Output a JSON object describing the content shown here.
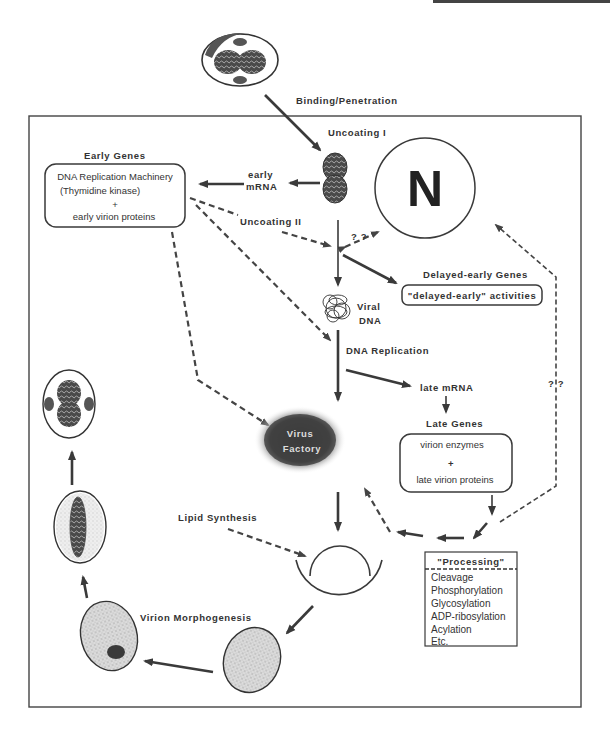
{
  "diagram": {
    "type": "viral replication cycle",
    "labels": {
      "binding": "Binding/Penetration",
      "uncoating1": "Uncoating  I",
      "uncoating2": "Uncoating  II",
      "early_mrna_1": "early",
      "early_mrna_2": "mRNA",
      "early_genes_title": "Early  Genes",
      "early_genes_line1": "DNA Replication Machinery",
      "early_genes_line2": "(Thymidine kinase)",
      "early_genes_plus": "+",
      "early_genes_line3": "early  virion  proteins",
      "nucleus": "N",
      "qq1": "? ?",
      "qq2": "? ?",
      "delayed_title": "Delayed-early  Genes",
      "delayed_box": "\"delayed-early\"  activities",
      "viral_dna_1": "Viral",
      "viral_dna_2": "DNA",
      "dna_replication": "DNA  Replication",
      "late_mrna": "late  mRNA",
      "late_genes_title": "Late  Genes",
      "late_genes_line1": "virion  enzymes",
      "late_genes_plus": "+",
      "late_genes_line2": "late  virion  proteins",
      "factory_1": "Virus",
      "factory_2": "Factory",
      "lipid": "Lipid  Synthesis",
      "morphogenesis": "Virion  Morphogenesis",
      "processing_title": "\"Processing\"",
      "processing_items": [
        "Cleavage",
        "Phosphorylation",
        "Glycosylation",
        "ADP-ribosylation",
        "Acylation",
        "Etc."
      ]
    },
    "colors": {
      "ink": "#3a3a3a",
      "stipple": "#c9c9c9",
      "dark_fill": "#555555",
      "background": "#ffffff"
    }
  }
}
